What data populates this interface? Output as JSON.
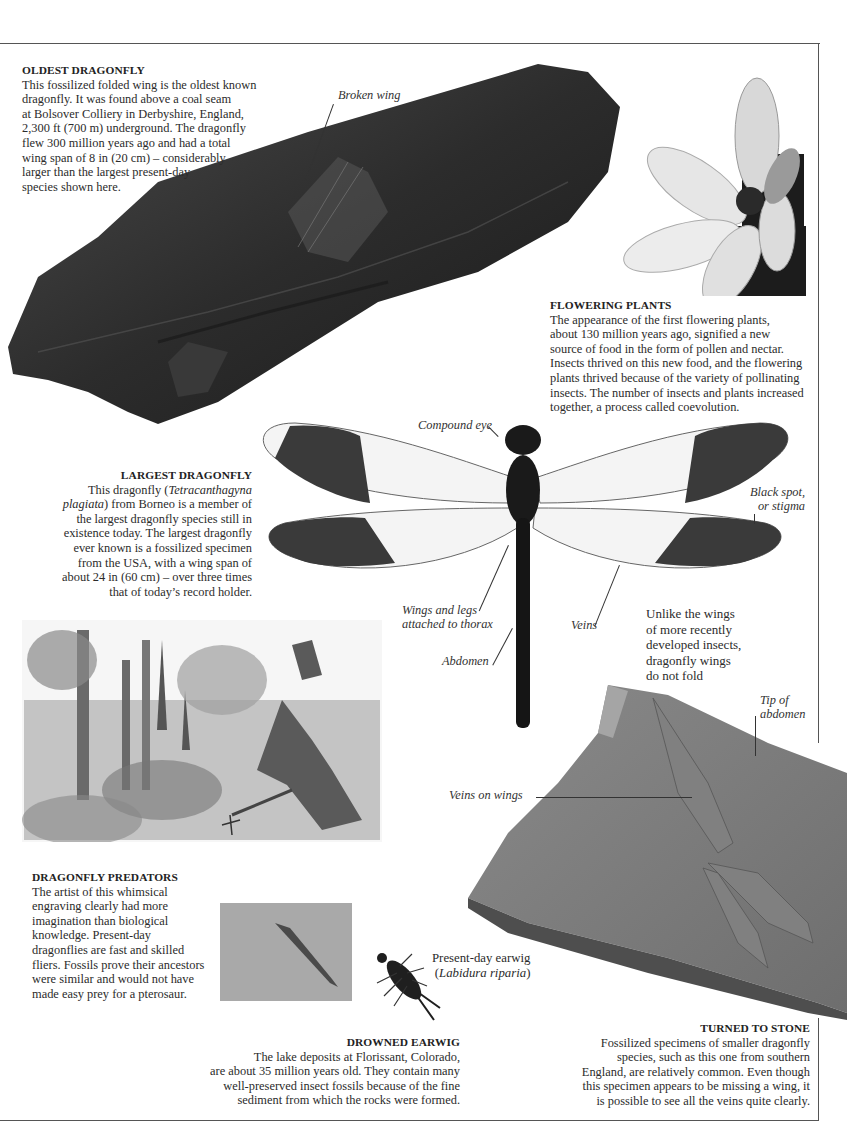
{
  "sections": {
    "oldest": {
      "heading": "OLDEST DRAGONFLY",
      "lines": [
        "This fossilized folded wing is the oldest known",
        "dragonfly. It was found above a coal seam",
        "at Bolsover Colliery in Derbyshire, England,",
        "2,300 ft (700 m) underground. The dragonfly",
        "flew 300 million years ago and had a total",
        "wing span of 8 in (20 cm) – considerably",
        "larger than the largest present-day",
        "species shown here."
      ],
      "label_broken_wing": "Broken wing"
    },
    "flowering": {
      "heading": "FLOWERING PLANTS",
      "lines": [
        "The appearance of the first flowering plants,",
        "about 130 million years ago, signified a new",
        "source of food in the form of pollen and nectar.",
        "Insects thrived on this new food, and the flowering",
        "plants thrived because of the variety of pollinating",
        "insects. The number of insects and plants increased",
        "together, a process called coevolution."
      ]
    },
    "largest": {
      "heading": "LARGEST DRAGONFLY",
      "line1_pre": "This dragonfly (",
      "line1_italic": "Tetracanthagyna",
      "line2_italic": "plagiata",
      "line2_post": ") from Borneo is a member of",
      "lines": [
        "the largest dragonfly species still in",
        "existence today. The largest dragonfly",
        "ever known is a fossilized specimen",
        "from the USA, with a wing span of",
        "about 24 in (60 cm) – over three times",
        "that of today’s record holder."
      ]
    },
    "dragonfly_labels": {
      "compound_eye": "Compound eye",
      "black_spot_1": "Black spot,",
      "black_spot_2": "or stigma",
      "wings_legs_1": "Wings and legs",
      "wings_legs_2": "attached to thorax",
      "abdomen": "Abdomen",
      "veins": "Veins"
    },
    "unlike": {
      "lines": [
        "Unlike the wings",
        "of more recently",
        "developed insects,",
        "dragonfly wings",
        "do not fold"
      ]
    },
    "predators": {
      "heading": "DRAGONFLY PREDATORS",
      "lines": [
        "The artist of this whimsical",
        "engraving clearly had more",
        "imagination than biological",
        "knowledge. Present-day",
        "dragonflies are fast and skilled",
        "fliers. Fossils prove their ancestors",
        "were similar and would not have",
        "made easy prey for a pterosaur."
      ]
    },
    "earwig_label": {
      "line1": "Present-day earwig",
      "line2_open": "(",
      "line2_italic": "Labidura riparia",
      "line2_close": ")"
    },
    "drowned": {
      "heading": "DROWNED EARWIG",
      "lines": [
        "The lake deposits at Florissant, Colorado,",
        "are about 35 million years old. They contain many",
        "well-preserved insect fossils because of the fine",
        "sediment from which the rocks were formed."
      ]
    },
    "stone": {
      "heading": "TURNED TO STONE",
      "lines": [
        "Fossilized specimens of smaller dragonfly",
        "species, such as this one from southern",
        "England, are relatively common. Even though",
        "this specimen appears to be missing a wing, it",
        "is possible to see all the veins quite clearly."
      ],
      "label_tip_1": "Tip of",
      "label_tip_2": "abdomen",
      "label_veins_on_wings": "Veins on wings"
    }
  },
  "colors": {
    "rule": "#555555",
    "rock_dark": "#2e2e2e",
    "stone_gray": "#7a7a7a",
    "text": "#2b2b2b"
  }
}
